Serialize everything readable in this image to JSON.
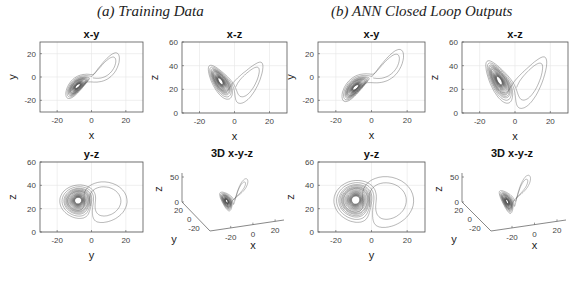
{
  "groups": [
    {
      "title": "(a) Training Data"
    },
    {
      "title": "(b) ANN Closed Loop Outputs"
    }
  ],
  "chart_data": [
    {
      "group": "(a) Training Data",
      "type": "line",
      "title": "x-y",
      "xlabel": "x",
      "ylabel": "y",
      "xlim": [
        -30,
        30
      ],
      "ylim": [
        -30,
        30
      ],
      "xticks": [
        -20,
        0,
        20
      ],
      "yticks": [
        -20,
        0,
        20
      ],
      "grid": true,
      "series": [
        {
          "name": "Lorenz trajectory (training)",
          "projection": [
            "x",
            "y"
          ],
          "sigma": 10,
          "rho": 28,
          "beta": 2.6667,
          "spread": 1.0
        }
      ]
    },
    {
      "group": "(a) Training Data",
      "type": "line",
      "title": "x-z",
      "xlabel": "x",
      "ylabel": "z",
      "xlim": [
        -30,
        30
      ],
      "ylim": [
        0,
        60
      ],
      "xticks": [
        -20,
        0,
        20
      ],
      "yticks": [
        0,
        20,
        40,
        60
      ],
      "grid": true,
      "series": [
        {
          "name": "Lorenz trajectory (training)",
          "projection": [
            "x",
            "z"
          ],
          "sigma": 10,
          "rho": 28,
          "beta": 2.6667,
          "spread": 1.0
        }
      ]
    },
    {
      "group": "(a) Training Data",
      "type": "line",
      "title": "y-z",
      "xlabel": "y",
      "ylabel": "z",
      "xlim": [
        -30,
        30
      ],
      "ylim": [
        0,
        60
      ],
      "xticks": [
        -20,
        0,
        20
      ],
      "yticks": [
        0,
        20,
        40,
        60
      ],
      "grid": true,
      "series": [
        {
          "name": "Lorenz trajectory (training)",
          "projection": [
            "y",
            "z"
          ],
          "sigma": 10,
          "rho": 28,
          "beta": 2.6667,
          "spread": 1.0
        }
      ]
    },
    {
      "group": "(a) Training Data",
      "type": "line",
      "title": "3D x-y-z",
      "xlabel": "x",
      "ylabel": "y",
      "zlabel": "z",
      "xticks": [
        -20,
        0,
        20
      ],
      "yticks": [
        -20,
        0,
        20
      ],
      "zticks": [
        0,
        50
      ],
      "grid": false,
      "series": [
        {
          "name": "Lorenz trajectory (training)",
          "projection": [
            "x",
            "y",
            "z"
          ],
          "sigma": 10,
          "rho": 28,
          "beta": 2.6667,
          "spread": 1.0
        }
      ]
    },
    {
      "group": "(b) ANN Closed Loop Outputs",
      "type": "line",
      "title": "x-y",
      "xlabel": "x",
      "ylabel": "y",
      "xlim": [
        -30,
        30
      ],
      "ylim": [
        -30,
        30
      ],
      "xticks": [
        -20,
        0,
        20
      ],
      "yticks": [
        -20,
        0,
        20
      ],
      "grid": true,
      "series": [
        {
          "name": "ANN closed-loop trajectory",
          "projection": [
            "x",
            "y"
          ],
          "sigma": 10,
          "rho": 28,
          "beta": 2.6667,
          "spread": 1.25
        }
      ]
    },
    {
      "group": "(b) ANN Closed Loop Outputs",
      "type": "line",
      "title": "x-z",
      "xlabel": "x",
      "ylabel": "z",
      "xlim": [
        -30,
        30
      ],
      "ylim": [
        0,
        60
      ],
      "xticks": [
        -20,
        0,
        20
      ],
      "yticks": [
        0,
        20,
        40,
        60
      ],
      "grid": true,
      "series": [
        {
          "name": "ANN closed-loop trajectory",
          "projection": [
            "x",
            "z"
          ],
          "sigma": 10,
          "rho": 28,
          "beta": 2.6667,
          "spread": 1.25
        }
      ]
    },
    {
      "group": "(b) ANN Closed Loop Outputs",
      "type": "line",
      "title": "y-z",
      "xlabel": "y",
      "ylabel": "z",
      "xlim": [
        -30,
        30
      ],
      "ylim": [
        0,
        60
      ],
      "xticks": [
        -20,
        0,
        20
      ],
      "yticks": [
        0,
        20,
        40,
        60
      ],
      "grid": true,
      "series": [
        {
          "name": "ANN closed-loop trajectory",
          "projection": [
            "y",
            "z"
          ],
          "sigma": 10,
          "rho": 28,
          "beta": 2.6667,
          "spread": 1.25
        }
      ]
    },
    {
      "group": "(b) ANN Closed Loop Outputs",
      "type": "line",
      "title": "3D x-y-z",
      "xlabel": "x",
      "ylabel": "y",
      "zlabel": "z",
      "xticks": [
        -20,
        0,
        20
      ],
      "yticks": [
        -20,
        0,
        20
      ],
      "zticks": [
        0,
        50
      ],
      "grid": false,
      "series": [
        {
          "name": "ANN closed-loop trajectory",
          "projection": [
            "x",
            "y",
            "z"
          ],
          "sigma": 10,
          "rho": 28,
          "beta": 2.6667,
          "spread": 1.25
        }
      ]
    }
  ]
}
